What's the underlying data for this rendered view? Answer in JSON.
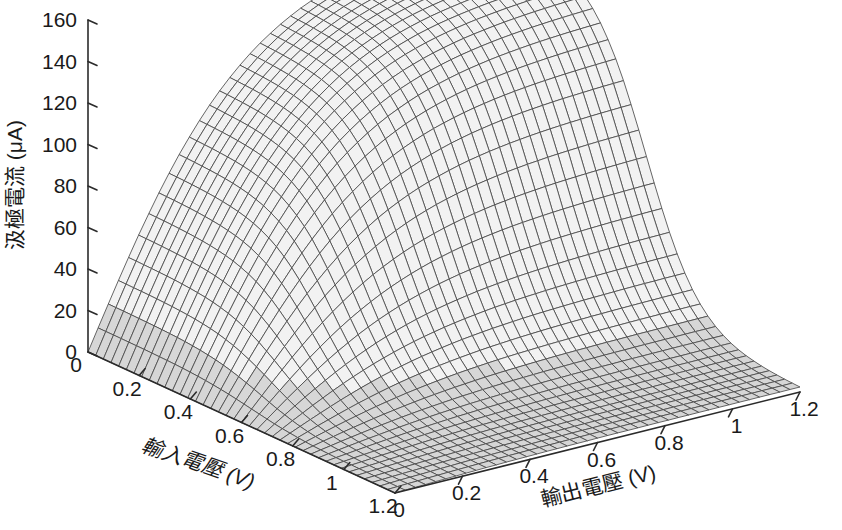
{
  "figure": {
    "kind": "3d-mesh-surface-plot",
    "background_color": "#ffffff",
    "mesh_line_color": "#4a4a4a",
    "mesh_face_color": "#f2f2f2",
    "axis_color": "#2b2b2b",
    "text_color": "#1a1a1a"
  },
  "axes": {
    "z": {
      "title": "汲極電流 (μA)",
      "unit": "μA",
      "ticks": [
        "0",
        "20",
        "40",
        "60",
        "80",
        "100",
        "120",
        "140",
        "160"
      ],
      "tick_values": [
        0,
        20,
        40,
        60,
        80,
        100,
        120,
        140,
        160
      ],
      "range": [
        0,
        160
      ]
    },
    "x_left": {
      "title": "輸入電壓 (V)",
      "unit": "V",
      "ticks": [
        "0",
        "0.2",
        "0.4",
        "0.6",
        "0.8",
        "1",
        "1.2"
      ],
      "tick_values": [
        0,
        0.2,
        0.4,
        0.6,
        0.8,
        1,
        1.2
      ],
      "range": [
        0,
        1.2
      ]
    },
    "y_right": {
      "title": "輸出電壓 (V)",
      "unit": "V",
      "ticks": [
        "0",
        "0.2",
        "0.4",
        "0.6",
        "0.8",
        "1",
        "1.2"
      ],
      "tick_values": [
        0,
        0.2,
        0.4,
        0.6,
        0.8,
        1,
        1.2
      ],
      "range": [
        0,
        1.2
      ]
    }
  },
  "chart_data": {
    "type": "surface",
    "title": "",
    "xlabel": "輸入電壓 (V)",
    "ylabel": "輸出電壓 (V)",
    "zlabel": "汲極電流 (μA)",
    "xlim": [
      0,
      1.2
    ],
    "ylim": [
      0,
      1.2
    ],
    "zlim": [
      0,
      160
    ],
    "grid": false,
    "legend": null,
    "mesh_divisions": 40,
    "x": [
      0,
      0.2,
      0.4,
      0.6,
      0.8,
      1.0,
      1.2
    ],
    "y": [
      0,
      0.2,
      0.4,
      0.6,
      0.8,
      1.0,
      1.2
    ],
    "z_rows_note": "rows indexed by x (輸入電壓), columns by y (輸出電壓); values in microamps",
    "z": [
      [
        0,
        38,
        74,
        108,
        134,
        150,
        157
      ],
      [
        0,
        36,
        71,
        104,
        130,
        146,
        154
      ],
      [
        0,
        30,
        60,
        90,
        114,
        130,
        139
      ],
      [
        0,
        17,
        35,
        53,
        69,
        81,
        88
      ],
      [
        0,
        5,
        11,
        17,
        22,
        27,
        30
      ],
      [
        0,
        1,
        2,
        3,
        4,
        5,
        6
      ],
      [
        0,
        0,
        1,
        1,
        1,
        2,
        2
      ]
    ],
    "peak_value": 160,
    "peak_at": {
      "x": 0,
      "y": 1.2
    }
  }
}
